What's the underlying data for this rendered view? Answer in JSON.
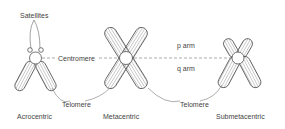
{
  "labels": {
    "satellites": "Satellites",
    "centromere": "Centromere",
    "p_arm": "p arm",
    "q_arm": "q arm",
    "telomere_left": "Telomere",
    "telomere_right": "Telomere"
  },
  "chromosomes": [
    {
      "type": "Acrocentric"
    },
    {
      "type": "Metacentric"
    },
    {
      "type": "Submetacentric"
    }
  ],
  "colors": {
    "line": "#555555",
    "hatch": "#777777",
    "text": "#444444"
  }
}
